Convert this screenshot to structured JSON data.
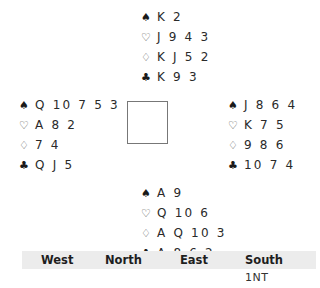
{
  "suits": {
    "spades": "♠",
    "hearts": "♡",
    "diamonds": "♢",
    "clubs": "♣"
  },
  "hands": {
    "north": {
      "spades": "K 2",
      "hearts": "J 9 4 3",
      "diamonds": "K J 5 2",
      "clubs": "K 9 3"
    },
    "west": {
      "spades": "Q 10 7 5 3",
      "hearts": "A 8 2",
      "diamonds": "7 4",
      "clubs": "Q J 5"
    },
    "east": {
      "spades": "J 8 6 4",
      "hearts": "K 7 5",
      "diamonds": "9 8 6",
      "clubs": "10 7 4"
    },
    "south": {
      "spades": "A 9",
      "hearts": "Q 10 6",
      "diamonds": "A Q 10 3",
      "clubs": "A 8 6 2"
    }
  },
  "bidding": {
    "headers": [
      "West",
      "North",
      "East",
      "South"
    ],
    "rows": [
      [
        "",
        "",
        "",
        "1NT"
      ]
    ]
  }
}
